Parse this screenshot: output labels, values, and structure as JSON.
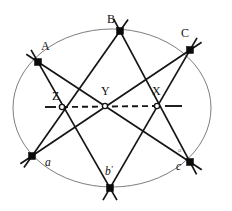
{
  "figure": {
    "background_color": "#ffffff",
    "stroke_color": "#141414",
    "conic_color": "#6e6e6e",
    "width": 232,
    "height": 211
  },
  "conic": {
    "name": "ellipse",
    "center": {
      "x": 112,
      "y": 108
    },
    "rx": 99,
    "ry": 79
  },
  "points": [
    {
      "id": "A",
      "label": "A",
      "x": 38,
      "y": 62,
      "label_x": 41,
      "label_y": 50,
      "kind": "vertex",
      "style": "upper"
    },
    {
      "id": "B",
      "label": "B",
      "x": 120,
      "y": 31,
      "label_x": 107,
      "label_y": 23,
      "kind": "vertex",
      "style": "upper"
    },
    {
      "id": "C",
      "label": "C",
      "x": 190,
      "y": 50,
      "label_x": 181,
      "label_y": 37,
      "kind": "vertex",
      "style": "upper"
    },
    {
      "id": "a",
      "label": "a",
      "x": 32,
      "y": 156,
      "label_x": 45,
      "label_y": 166,
      "kind": "vertex",
      "style": "lower"
    },
    {
      "id": "b",
      "label": "b",
      "x": 110,
      "y": 188,
      "label_x": 105,
      "label_y": 175,
      "kind": "vertex",
      "style": "lower",
      "prime": "'"
    },
    {
      "id": "c",
      "label": "c",
      "x": 190,
      "y": 162,
      "label_x": 176,
      "label_y": 170,
      "kind": "vertex",
      "style": "lower"
    },
    {
      "id": "Z",
      "label": "Z",
      "x": 62,
      "y": 107,
      "label_x": 52,
      "label_y": 100,
      "kind": "intersection",
      "style": "upper"
    },
    {
      "id": "Y",
      "label": "Y",
      "x": 105,
      "y": 106,
      "label_x": 101,
      "label_y": 95,
      "kind": "intersection",
      "style": "upper"
    },
    {
      "id": "X",
      "label": "X",
      "x": 157,
      "y": 106,
      "label_x": 152,
      "label_y": 95,
      "kind": "intersection",
      "style": "upper"
    }
  ],
  "chords": [
    {
      "name": "A-to-c",
      "from": "A",
      "to": "c",
      "x1": 38,
      "y1": 62,
      "x2": 190,
      "y2": 162,
      "extend": 14
    },
    {
      "name": "A-to-b",
      "from": "A",
      "to": "b",
      "x1": 38,
      "y1": 62,
      "x2": 110,
      "y2": 188,
      "extend": 14
    },
    {
      "name": "B-to-a",
      "from": "B",
      "to": "a",
      "x1": 120,
      "y1": 31,
      "x2": 32,
      "y2": 156,
      "extend": 14
    },
    {
      "name": "B-to-c",
      "from": "B",
      "to": "c",
      "x1": 120,
      "y1": 31,
      "x2": 190,
      "y2": 162,
      "extend": 14
    },
    {
      "name": "C-to-a",
      "from": "C",
      "to": "a",
      "x1": 190,
      "y1": 50,
      "x2": 32,
      "y2": 156,
      "extend": 14
    },
    {
      "name": "C-to-b",
      "from": "C",
      "to": "b",
      "x1": 190,
      "y1": 50,
      "x2": 110,
      "y2": 188,
      "extend": 14
    }
  ],
  "axis": {
    "name": "collinear-axis",
    "style": "dashed",
    "from_label": "Z",
    "to_label": "X",
    "x1": 62,
    "y1": 107,
    "x2": 157,
    "y2": 106,
    "stub_left": {
      "x1": 45,
      "y1": 107,
      "x2": 56,
      "y2": 107
    },
    "stub_right": {
      "x1": 165,
      "y1": 106,
      "x2": 182,
      "y2": 106
    }
  },
  "marks": {
    "faint_mark_near_c": "a"
  }
}
